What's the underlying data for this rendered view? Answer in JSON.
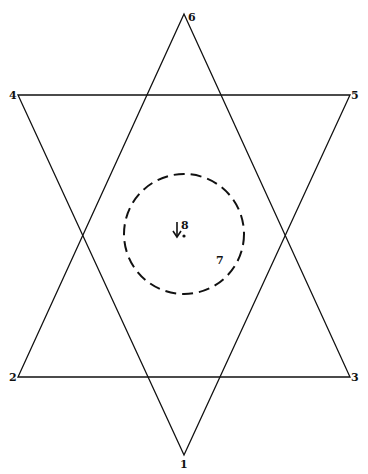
{
  "diagram": {
    "type": "hexagram",
    "stroke_color": "#111111",
    "background": "#ffffff",
    "vertices": [
      {
        "id": "1",
        "label": "1",
        "x": 184,
        "y": 455
      },
      {
        "id": "2",
        "label": "2",
        "x": 18,
        "y": 377
      },
      {
        "id": "3",
        "label": "3",
        "x": 350,
        "y": 377
      },
      {
        "id": "4",
        "label": "4",
        "x": 18,
        "y": 95
      },
      {
        "id": "5",
        "label": "5",
        "x": 350,
        "y": 95
      },
      {
        "id": "6",
        "label": "6",
        "x": 184,
        "y": 14
      }
    ],
    "triangles": [
      {
        "name": "triangle-up",
        "vertices": [
          "6",
          "2",
          "3"
        ]
      },
      {
        "name": "triangle-down",
        "vertices": [
          "4",
          "5",
          "1"
        ]
      }
    ],
    "circle": {
      "cx": 184,
      "cy": 234,
      "r": 60,
      "style": "dashed"
    },
    "center_point": {
      "label": "8",
      "x": 183,
      "y": 235
    },
    "region_label": {
      "label": "7",
      "x": 220,
      "y": 263
    },
    "labels": {
      "v1": "1",
      "v2": "2",
      "v3": "3",
      "v4": "4",
      "v5": "5",
      "v6": "6",
      "center": "8",
      "region": "7"
    }
  }
}
